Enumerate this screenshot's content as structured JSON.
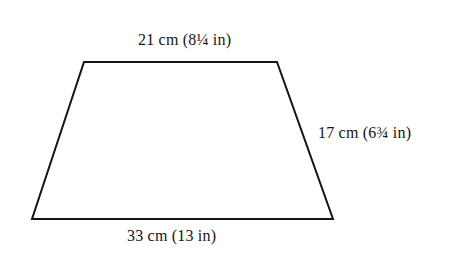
{
  "figure": {
    "shape_name": "trapezoid",
    "stroke_color": "#151515",
    "fill_color": "#ffffff",
    "background_color": "#ffffff",
    "stroke_width": 2,
    "vertices": {
      "top_left": [
        84,
        62
      ],
      "top_right": [
        277,
        62
      ],
      "bottom_right": [
        333,
        219
      ],
      "bottom_left": [
        32,
        219
      ]
    }
  },
  "labels": {
    "top": "21 cm (8¼ in)",
    "right": "17 cm (6¾ in)",
    "bottom": "33 cm (13 in)"
  },
  "measurements": {
    "top_side": {
      "metric_value": 21,
      "metric_unit": "cm",
      "imperial_value": "8¼",
      "imperial_unit": "in"
    },
    "right_side": {
      "metric_value": 17,
      "metric_unit": "cm",
      "imperial_value": "6¾",
      "imperial_unit": "in"
    },
    "bottom_side": {
      "metric_value": 33,
      "metric_unit": "cm",
      "imperial_value": "13",
      "imperial_unit": "in"
    }
  }
}
